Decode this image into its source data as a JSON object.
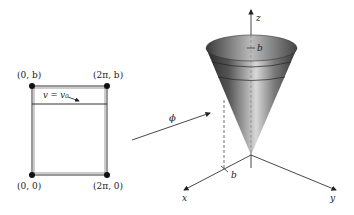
{
  "rectangle": {
    "corners": {
      "top_left": "(0, b)",
      "top_right": "(2π, b)",
      "bottom_left": "(0, 0)",
      "bottom_right": "(2π, 0)"
    },
    "line_label": "v = v₀"
  },
  "mapping": {
    "arrow_label": "ϕ"
  },
  "cone": {
    "axis_labels": {
      "z": "z",
      "x": "x",
      "y": "y"
    },
    "height_label": "b",
    "radius_label": "b"
  }
}
